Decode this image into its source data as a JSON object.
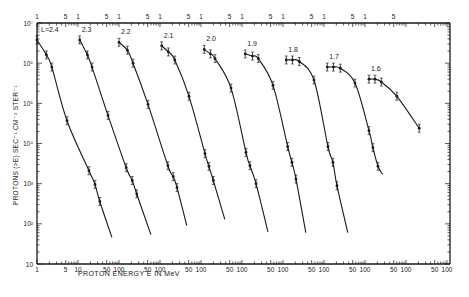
{
  "chart_data": {
    "type": "line",
    "title": "",
    "xlabel": "PROTON ENERGY E IN MeV",
    "ylabel": "PROTONS (>E) SEC⁻¹ CM⁻² STER⁻¹",
    "yscale": "log",
    "xscale": "log",
    "ylim": [
      10,
      10000000
    ],
    "y_ticks": [
      {
        "value": 10000000,
        "label": "10⁷"
      },
      {
        "value": 1000000,
        "label": "10⁶"
      },
      {
        "value": 100000,
        "label": "10⁵"
      },
      {
        "value": 10000,
        "label": "10⁴"
      },
      {
        "value": 1000,
        "label": "10³"
      },
      {
        "value": 100,
        "label": "10²"
      },
      {
        "value": 10,
        "label": "10"
      }
    ],
    "x_layout": "staggered: each L-shell curve is offset by one decade; top axis marks E=1 and 5 MeV per curve, bottom axis marks 5/10/50/100 MeV",
    "top_axis_labels": [
      "1",
      "5",
      "1",
      "5",
      "1",
      "5",
      "1",
      "5",
      "1",
      "5",
      "1",
      "5",
      "1",
      "5",
      "1",
      "5",
      "1",
      "5"
    ],
    "bottom_axis_labels": [
      "1",
      "5",
      "10",
      "50",
      "100",
      "50",
      "100",
      "50",
      "100",
      "50",
      "100",
      "50",
      "100",
      "50",
      "100",
      "50",
      "100",
      "50",
      "100"
    ],
    "grid": false,
    "legend": "curve labels placed above each curve",
    "series": [
      {
        "name": "L=2.4",
        "label": "L=2.4",
        "points": [
          [
            1.0,
            3800000
          ],
          [
            1.7,
            1600000
          ],
          [
            2.3,
            800000
          ],
          [
            5.4,
            37000
          ],
          [
            18.5,
            2100
          ],
          [
            26,
            960
          ],
          [
            34,
            360
          ]
        ],
        "curve_end": [
          67,
          46
        ]
      },
      {
        "name": "L=2.3",
        "label": "2.3",
        "points": [
          [
            1.1,
            3800000
          ],
          [
            1.7,
            1600000
          ],
          [
            2.2,
            800000
          ],
          [
            5.4,
            50000
          ],
          [
            15,
            2500
          ],
          [
            21,
            1200
          ],
          [
            27,
            560
          ]
        ],
        "curve_end": [
          60,
          54
        ]
      },
      {
        "name": "L=2.2",
        "label": "2.2",
        "points": [
          [
            1.0,
            3300000
          ],
          [
            1.6,
            2100000
          ],
          [
            2.2,
            1000000
          ],
          [
            5.1,
            94000
          ],
          [
            15.6,
            2800
          ],
          [
            21,
            1500
          ],
          [
            26,
            800
          ]
        ],
        "curve_end": [
          45,
          90
        ]
      },
      {
        "name": "L=2.1",
        "label": "2.1",
        "points": [
          [
            1.1,
            2700000
          ],
          [
            1.6,
            1900000
          ],
          [
            2.3,
            1200000
          ],
          [
            5.1,
            150000
          ],
          [
            12.5,
            5600
          ],
          [
            15.6,
            2700
          ],
          [
            20,
            1200
          ]
        ],
        "curve_end": [
          38,
          130
        ]
      },
      {
        "name": "L=2.0",
        "label": "2.0",
        "points": [
          [
            1.2,
            2200000
          ],
          [
            1.7,
            1700000
          ],
          [
            2.2,
            1300000
          ],
          [
            5.4,
            240000
          ],
          [
            12.5,
            6000
          ],
          [
            15.6,
            2800
          ],
          [
            22,
            1000
          ]
        ],
        "curve_end": [
          43,
          63
        ]
      },
      {
        "name": "L=1.9",
        "label": "1.9",
        "points": [
          [
            1.2,
            1700000
          ],
          [
            1.8,
            1500000
          ],
          [
            2.5,
            1300000
          ],
          [
            5.7,
            280000
          ],
          [
            13,
            8400
          ],
          [
            16.5,
            3400
          ],
          [
            20.7,
            1300
          ]
        ],
        "curve_end": [
          36,
          60
        ]
      },
      {
        "name": "L=1.8",
        "label": "1.8",
        "points": [
          [
            1.2,
            1200000
          ],
          [
            1.7,
            1200000
          ],
          [
            2.5,
            1100000
          ],
          [
            5.7,
            380000
          ],
          [
            12.5,
            8400
          ],
          [
            16.5,
            3400
          ],
          [
            20.7,
            890
          ]
        ],
        "curve_end": [
          38,
          60
        ]
      },
      {
        "name": "L=1.7",
        "label": "1.7",
        "points": [
          [
            1.2,
            800000
          ],
          [
            1.7,
            800000
          ],
          [
            2.5,
            750000
          ],
          [
            5.7,
            320000
          ],
          [
            12.5,
            21000
          ],
          [
            15.6,
            7900
          ],
          [
            20.7,
            2700
          ]
        ],
        "curve_end": [
          27,
          1700
        ]
      },
      {
        "name": "L=1.6",
        "label": "1.6",
        "points": [
          [
            1.25,
            400000
          ],
          [
            1.75,
            400000
          ],
          [
            2.5,
            340000
          ],
          [
            6.0,
            150000
          ],
          [
            21,
            24000
          ]
        ],
        "curve_end": [
          21,
          24000
        ]
      }
    ]
  }
}
